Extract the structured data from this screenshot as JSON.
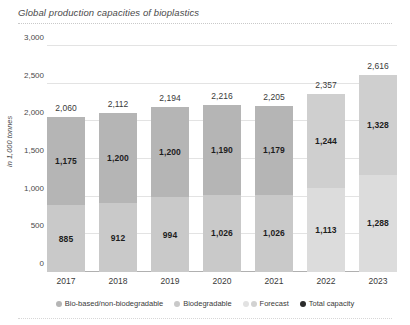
{
  "header": {
    "title": "Global production capacities of bioplastics"
  },
  "chart_data": {
    "type": "bar",
    "stacked": true,
    "title": "Global production capacities of bioplastics",
    "xlabel": "",
    "ylabel": "in 1,000 tonnes",
    "ylim": [
      0,
      3000
    ],
    "yticks": [
      "0",
      "500",
      "1,000",
      "1,500",
      "2,000",
      "2,500",
      "3,000"
    ],
    "ytick_values": [
      0,
      500,
      1000,
      1500,
      2000,
      2500,
      3000
    ],
    "grid": true,
    "legend_position": "bottom",
    "categories": [
      "2017",
      "2018",
      "2019",
      "2020",
      "2021",
      "2022",
      "2023"
    ],
    "forecast_categories": [
      "2022",
      "2023"
    ],
    "series": [
      {
        "name": "Biodegradable",
        "values": [
          885,
          912,
          994,
          1026,
          1026,
          1113,
          1288
        ],
        "labels": [
          "885",
          "912",
          "994",
          "1,026",
          "1,026",
          "1,113",
          "1,288"
        ],
        "color": "#c9c9c9",
        "forecast_color": "#dcdcdc",
        "stack_position": "bottom"
      },
      {
        "name": "Bio-based/non-biodegradable",
        "values": [
          1175,
          1200,
          1200,
          1190,
          1179,
          1244,
          1328
        ],
        "labels": [
          "1,175",
          "1,200",
          "1,200",
          "1,190",
          "1,179",
          "1,244",
          "1,328"
        ],
        "color": "#b5b5b5",
        "forecast_color": "#cfcfcf",
        "stack_position": "top"
      }
    ],
    "totals": {
      "name": "Total capacity",
      "values": [
        2060,
        2112,
        2194,
        2216,
        2205,
        2357,
        2616
      ],
      "labels": [
        "2,060",
        "2,112",
        "2,194",
        "2,216",
        "2,205",
        "2,357",
        "2,616"
      ]
    }
  },
  "legend": {
    "items": [
      {
        "label": "Bio-based/non-biodegradable",
        "marker": "dot",
        "color": "#b5b5b5"
      },
      {
        "label": "Biodegradable",
        "marker": "dot",
        "color": "#c9c9c9"
      },
      {
        "label": "Forecast",
        "marker": "double-dot",
        "color": "#e2e2e2",
        "color2": "#d2d2d2"
      },
      {
        "label": "Total capacity",
        "marker": "dot",
        "color": "#2b2b2b"
      }
    ]
  }
}
